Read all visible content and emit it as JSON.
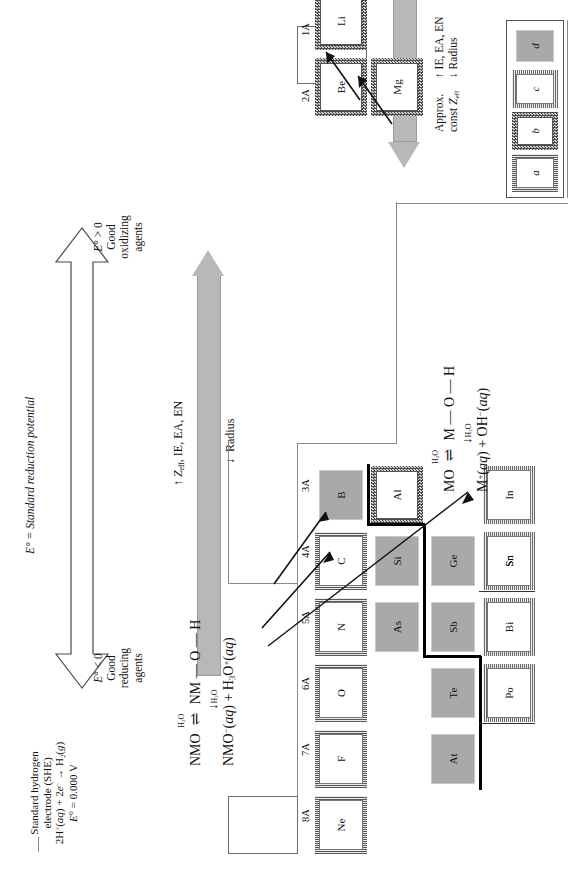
{
  "figure": {
    "kind": "periodic-trends-diagram",
    "orientation": "rotated-90-ccw"
  },
  "she_note": {
    "line1": "Standard hydrogen",
    "line2": "electrode (SHE)",
    "line3": "2H⁺(aq) + 2e⁻ → H₂(g)",
    "line4": "E° = 0.000 V"
  },
  "potential_arrow": {
    "axis_label": "E° = Standard reduction potential",
    "top": {
      "line1": "E° > 0",
      "line2": "Good",
      "line3": "oxidizing",
      "line4": "agents"
    },
    "bottom": {
      "line1": "E° < 0",
      "line2": "Good",
      "line3": "reducing",
      "line4": "agents"
    }
  },
  "vertical_trend": {
    "line1": "↑ Zₑꟳ, IE, EA, EN",
    "line2": "↓ Radius",
    "zeff_main": "Z",
    "zeff_sub": "eff",
    "first_prefix": "↑ ",
    "first_rest": ", IE, EA, EN",
    "second": "↓  Radius"
  },
  "horizontal_trend": {
    "line1": "Approx.",
    "line2_main": "const Z",
    "line2_sub": "eff",
    "line3": "↑  IE, EA, EN",
    "line4": "↓  Radius"
  },
  "nonmetal_oxide_eq": {
    "line1_a": "NMO",
    "line1_over": "H",
    "line1_over_sub": "2",
    "line1_over_tail": "O",
    "line1_arrow": "⇌",
    "line1_b": "NM — O — H",
    "down_arrow": "↓",
    "down_label_a": "H",
    "down_label_sub": "2",
    "down_label_b": "O",
    "line2": "NMO⁻(aq) + H₃O⁺(aq)"
  },
  "metal_oxide_eq": {
    "line1_a": "MO",
    "line1_over": "H",
    "line1_over_sub": "2",
    "line1_over_tail": "O",
    "line1_arrow": "⇌",
    "line1_b": "M — O — H",
    "down_arrow": "↓",
    "down_label_a": "H",
    "down_label_sub": "2",
    "down_label_b": "O",
    "line2": "M⁺(aq) + OH⁻(aq)"
  },
  "groups": [
    {
      "id": "1A",
      "label": "1A"
    },
    {
      "id": "2A",
      "label": "2A"
    },
    {
      "id": "3A",
      "label": "3A"
    },
    {
      "id": "4A",
      "label": "4A"
    },
    {
      "id": "5A",
      "label": "5A"
    },
    {
      "id": "6A",
      "label": "6A"
    },
    {
      "id": "7A",
      "label": "7A"
    },
    {
      "id": "8A",
      "label": "8A"
    }
  ],
  "elements": [
    {
      "symbol": "Li",
      "group": "1A",
      "period": 2,
      "type": "b"
    },
    {
      "symbol": "Be",
      "group": "2A",
      "period": 2,
      "type": "b"
    },
    {
      "symbol": "B",
      "group": "3A",
      "period": 2,
      "type": "d"
    },
    {
      "symbol": "C",
      "group": "4A",
      "period": 2,
      "type": "a"
    },
    {
      "symbol": "N",
      "group": "5A",
      "period": 2,
      "type": "a"
    },
    {
      "symbol": "O",
      "group": "6A",
      "period": 2,
      "type": "a"
    },
    {
      "symbol": "F",
      "group": "7A",
      "period": 2,
      "type": "a"
    },
    {
      "symbol": "Ne",
      "group": "8A",
      "period": 2,
      "type": "a"
    },
    {
      "symbol": "Mg",
      "group": "2A",
      "period": 3,
      "type": "b"
    },
    {
      "symbol": "Al",
      "group": "3A",
      "period": 3,
      "type": "b"
    },
    {
      "symbol": "Si",
      "group": "4A",
      "period": 3,
      "type": "d"
    },
    {
      "symbol": "Ge",
      "group": "4A",
      "period": 4,
      "type": "d"
    },
    {
      "symbol": "As",
      "group": "5A",
      "period": 4,
      "type": "d"
    },
    {
      "symbol": "In",
      "group": "3A",
      "period": 5,
      "type": "c"
    },
    {
      "symbol": "Sn",
      "group": "4A",
      "period": 5,
      "type": "c"
    },
    {
      "symbol": "Sb",
      "group": "5A",
      "period": 5,
      "type": "d"
    },
    {
      "symbol": "Te",
      "group": "6A",
      "period": 5,
      "type": "d"
    },
    {
      "symbol": "Tl",
      "group": "3A",
      "period": 6,
      "type": "c"
    },
    {
      "symbol": "Pb",
      "group": "4A",
      "period": 6,
      "type": "c"
    },
    {
      "symbol": "Bi",
      "group": "5A",
      "period": 6,
      "type": "c"
    },
    {
      "symbol": "Po",
      "group": "6A",
      "period": 6,
      "type": "c"
    },
    {
      "symbol": "At",
      "group": "7A",
      "period": 6,
      "type": "d"
    }
  ],
  "legend": [
    {
      "key": "a",
      "label": "a",
      "type": "a"
    },
    {
      "key": "b",
      "label": "b",
      "type": "b"
    },
    {
      "key": "c",
      "label": "c",
      "type": "c"
    },
    {
      "key": "d",
      "label": "d",
      "type": "d"
    }
  ],
  "colors": {
    "metalloid_fill": "#a9a9a9",
    "grey_arrow": "#b8b8b8",
    "rule": "#6d6d6d",
    "heavy_rule": "#000000"
  }
}
